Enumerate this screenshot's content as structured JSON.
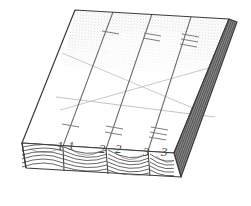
{
  "figure": {
    "type": "technical-line-drawing",
    "background_color": "#ffffff",
    "outline_color": "#3a3a3a",
    "faint_line_color": "#b4b4b4",
    "grain_color": "#4a4a4a",
    "shade_color": "#6e6e6e",
    "hatch_color": "#9a9a9a"
  },
  "board": {
    "top_face": {
      "name": "top-face",
      "corners": [
        [
          75,
          10
        ],
        [
          229,
          19
        ],
        [
          174,
          153
        ],
        [
          22,
          143
        ]
      ],
      "hatched_region_label": "stippled-shading"
    },
    "front_face": {
      "name": "front-edge-face",
      "corners": [
        [
          22,
          143
        ],
        [
          174,
          153
        ],
        [
          174,
          178
        ],
        [
          22,
          168
        ]
      ],
      "segments": 4
    },
    "right_face": {
      "name": "right-end-face",
      "corners": [
        [
          229,
          19
        ],
        [
          237,
          22
        ],
        [
          181,
          177
        ],
        [
          174,
          153
        ]
      ]
    }
  },
  "division_lines": [
    {
      "name": "division-line-1",
      "from": [
        113,
        12
      ],
      "to": [
        63,
        146
      ]
    },
    {
      "name": "division-line-2",
      "from": [
        152,
        14
      ],
      "to": [
        106,
        149
      ]
    },
    {
      "name": "division-line-3",
      "from": [
        191,
        17
      ],
      "to": [
        148,
        151
      ]
    }
  ],
  "diagonal_marks": [
    {
      "name": "diagonal-x-line-a",
      "from": [
        56,
        97
      ],
      "to": [
        215,
        117
      ]
    },
    {
      "name": "diagonal-x-line-b",
      "from": [
        68,
        54
      ],
      "to": [
        212,
        63
      ]
    }
  ],
  "pencil_marks": [
    {
      "id": "mark-1-left",
      "label": "1",
      "x": 57,
      "y": 150,
      "ticks": 1
    },
    {
      "id": "mark-1-right",
      "label": "1",
      "x": 68,
      "y": 150,
      "ticks": 1
    },
    {
      "id": "mark-2-left",
      "label": "2",
      "x": 101,
      "y": 153,
      "ticks": 2
    },
    {
      "id": "mark-2-right",
      "label": "2",
      "x": 117,
      "y": 153,
      "ticks": 2
    },
    {
      "id": "mark-3-left",
      "label": "3",
      "x": 145,
      "y": 156,
      "ticks": 3
    },
    {
      "id": "mark-3-right",
      "label": "3",
      "x": 162,
      "y": 156,
      "ticks": 3
    }
  ],
  "tick_groups": [
    {
      "name": "tick-group-lower-1",
      "line": 1,
      "count": 1,
      "at": [
        70,
        128
      ]
    },
    {
      "name": "tick-group-lower-2",
      "line": 2,
      "count": 2,
      "at": [
        114,
        131
      ]
    },
    {
      "name": "tick-group-lower-3",
      "line": 3,
      "count": 3,
      "at": [
        159,
        134
      ]
    },
    {
      "name": "tick-group-upper-1",
      "line": 1,
      "count": 1,
      "at": [
        110,
        33
      ]
    },
    {
      "name": "tick-group-upper-2",
      "line": 2,
      "count": 2,
      "at": [
        152,
        35
      ]
    },
    {
      "name": "tick-group-upper-3",
      "line": 3,
      "count": 3,
      "at": [
        190,
        37
      ]
    }
  ],
  "caption": {
    "visible": false,
    "text": ""
  }
}
